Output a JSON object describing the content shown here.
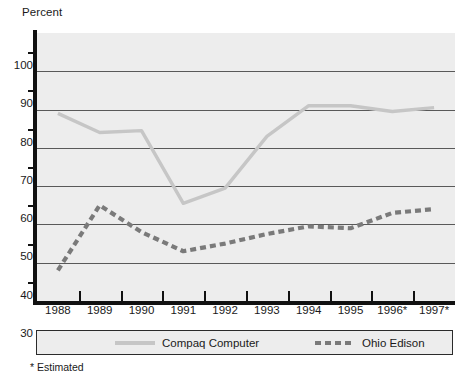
{
  "axis_title_y": "Percent",
  "footnote": "* Estimated",
  "legend": {
    "items": [
      {
        "label": "Compaq Computer",
        "style": "solid",
        "color": "#c6c6c6"
      },
      {
        "label": "Ohio Edison",
        "style": "dashed",
        "color": "#7a7a7a"
      }
    ]
  },
  "chart_data": {
    "type": "line",
    "title": "",
    "xlabel": "",
    "ylabel": "Percent",
    "categories": [
      "1988",
      "1989",
      "1990",
      "1991",
      "1992",
      "1993",
      "1994",
      "1995",
      "1996*",
      "1997*"
    ],
    "series": [
      {
        "name": "Compaq Computer",
        "color": "#c6c6c6",
        "style": "solid",
        "values": [
          79,
          74,
          74.5,
          55.5,
          59.5,
          73,
          81,
          81,
          79.5,
          80.5
        ]
      },
      {
        "name": "Ohio Edison",
        "color": "#7a7a7a",
        "style": "dashed",
        "values": [
          38,
          55,
          48,
          43,
          45,
          47.5,
          49.5,
          49,
          53,
          54
        ]
      }
    ],
    "ylim": [
      30,
      100
    ],
    "yticks_major": [
      30,
      40,
      50,
      60,
      70,
      80,
      90,
      100
    ],
    "yticks_minor": [
      35,
      45,
      55,
      65,
      75,
      85,
      95
    ],
    "ytick_labels": [
      "30",
      "40",
      "50",
      "60",
      "70",
      "80",
      "90",
      "100"
    ],
    "grid": true,
    "grid_axis": "y",
    "legend_position": "below",
    "plot_background": "#ededed",
    "gridline_color": "#595959",
    "axis_color": "#111111"
  }
}
